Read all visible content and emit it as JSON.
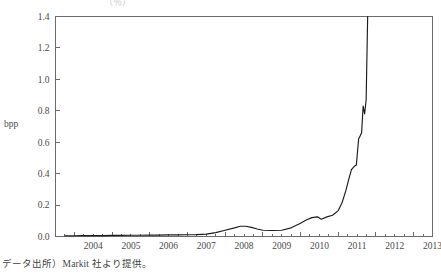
{
  "figure": {
    "truncated_title": "（％）",
    "caption": "データ出所）Markit 社より提供。",
    "line_color": "#1c1c1c",
    "axis_color": "#6b6b6b",
    "background": "#ffffff"
  },
  "chart_data": {
    "type": "line",
    "title": "",
    "subtitle": "",
    "xlabel": "",
    "ylabel": "bpp",
    "ylim": [
      0.0,
      1.4
    ],
    "xlim": [
      2003.5,
      2013.5
    ],
    "grid": false,
    "legend": false,
    "legend_position": "none",
    "ytick_labels": [
      "0.0",
      "0.2",
      "0.4",
      "0.6",
      "0.8",
      "1.0",
      "1.2",
      "1.4"
    ],
    "ytick_values": [
      0.0,
      0.2,
      0.4,
      0.6,
      0.8,
      1.0,
      1.2,
      1.4
    ],
    "xtick_labels": [
      "2004",
      "2005",
      "2006",
      "2007",
      "2008",
      "2009",
      "2010",
      "2011",
      "2012",
      "2013"
    ],
    "xtick_values": [
      2004,
      2005,
      2006,
      2007,
      2008,
      2009,
      2010,
      2011,
      2012,
      2013
    ],
    "x_minor_per_major": 4,
    "series": [
      {
        "name": "bpp",
        "x": [
          2003.75,
          2004.0,
          2004.25,
          2004.5,
          2004.75,
          2005.0,
          2005.25,
          2005.5,
          2005.75,
          2006.0,
          2006.25,
          2006.5,
          2006.75,
          2007.0,
          2007.25,
          2007.5,
          2007.75,
          2008.0,
          2008.25,
          2008.4,
          2008.55,
          2008.7,
          2008.85,
          2009.0,
          2009.25,
          2009.5,
          2009.75,
          2010.0,
          2010.15,
          2010.3,
          2010.45,
          2010.55,
          2010.7,
          2010.85,
          2011.0,
          2011.1,
          2011.2,
          2011.28,
          2011.35,
          2011.42,
          2011.48,
          2011.54,
          2011.58,
          2011.62,
          2011.66,
          2011.7,
          2011.74,
          2011.78
        ],
        "y": [
          0.005,
          0.005,
          0.006,
          0.006,
          0.006,
          0.007,
          0.007,
          0.008,
          0.008,
          0.009,
          0.009,
          0.01,
          0.01,
          0.011,
          0.012,
          0.015,
          0.025,
          0.04,
          0.055,
          0.065,
          0.065,
          0.058,
          0.048,
          0.04,
          0.038,
          0.04,
          0.055,
          0.085,
          0.105,
          0.12,
          0.125,
          0.11,
          0.125,
          0.135,
          0.165,
          0.215,
          0.29,
          0.365,
          0.425,
          0.445,
          0.455,
          0.62,
          0.64,
          0.66,
          0.83,
          0.78,
          0.87,
          1.4
        ]
      }
    ]
  }
}
